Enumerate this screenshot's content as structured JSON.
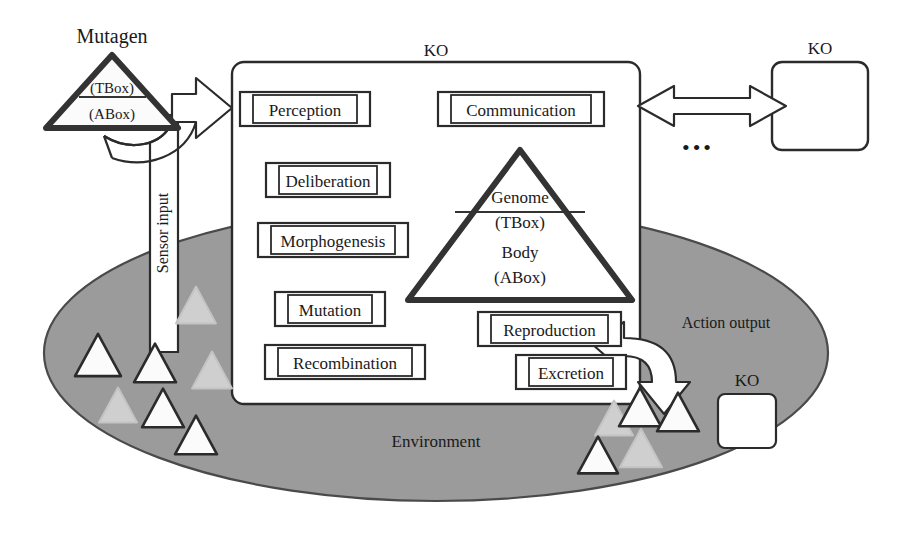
{
  "colors": {
    "environment_fill": "#9b9b9b",
    "environment_stroke": "#4a4a4a",
    "stroke": "#2b2b2b",
    "thick_stroke": "#333333",
    "triangle_white": "#fbfbfb",
    "triangle_faded": "#cfcfcf",
    "panel_fill": "#ffffff",
    "text": "#1a1a1a"
  },
  "labels": {
    "mutagen": "Mutagen",
    "ko_main": "KO",
    "ko_peer": "KO",
    "ko_env": "KO",
    "environment": "Environment",
    "sensor_input": "Sensor input",
    "action_output": "Action output",
    "ellipsis": "•••"
  },
  "mutagen_triangle": {
    "top_label": "(TBox)",
    "bottom_label": "(ABox)"
  },
  "genome_triangle": {
    "top_line1": "Genome",
    "top_line2": "(TBox)",
    "bottom_line1": "Body",
    "bottom_line2": "(ABox)"
  },
  "modules": [
    {
      "id": "perception",
      "label": "Perception",
      "x": 240,
      "y": 92,
      "w": 130,
      "h": 34
    },
    {
      "id": "communication",
      "label": "Communication",
      "x": 438,
      "y": 92,
      "w": 166,
      "h": 34
    },
    {
      "id": "deliberation",
      "label": "Deliberation",
      "x": 266,
      "y": 163,
      "w": 124,
      "h": 34
    },
    {
      "id": "morphogenesis",
      "label": "Morphogenesis",
      "x": 258,
      "y": 223,
      "w": 150,
      "h": 34
    },
    {
      "id": "mutation",
      "label": "Mutation",
      "x": 275,
      "y": 292,
      "w": 110,
      "h": 34
    },
    {
      "id": "recombination",
      "label": "Recombination",
      "x": 265,
      "y": 345,
      "w": 160,
      "h": 34
    },
    {
      "id": "reproduction",
      "label": "Reproduction",
      "x": 478,
      "y": 312,
      "w": 143,
      "h": 34
    },
    {
      "id": "excretion",
      "label": "Excretion",
      "x": 516,
      "y": 355,
      "w": 110,
      "h": 34
    }
  ],
  "ko_main_box": {
    "x": 232,
    "y": 62,
    "w": 408,
    "h": 342,
    "r": 12
  },
  "ko_peer_box": {
    "x": 772,
    "y": 62,
    "w": 96,
    "h": 88,
    "r": 10
  },
  "ko_env_box": {
    "x": 718,
    "y": 394,
    "w": 58,
    "h": 54,
    "r": 7
  },
  "environment_ellipse": {
    "cx": 436,
    "cy": 353,
    "rx": 392,
    "ry": 148
  },
  "env_triangles": [
    {
      "x": 98,
      "y": 355,
      "s": 46,
      "style": "white"
    },
    {
      "x": 155,
      "y": 363,
      "s": 42,
      "style": "white"
    },
    {
      "x": 196,
      "y": 305,
      "s": 40,
      "style": "faded"
    },
    {
      "x": 212,
      "y": 370,
      "s": 40,
      "style": "faded"
    },
    {
      "x": 118,
      "y": 405,
      "s": 38,
      "style": "faded"
    },
    {
      "x": 163,
      "y": 408,
      "s": 42,
      "style": "white"
    },
    {
      "x": 196,
      "y": 435,
      "s": 42,
      "style": "white"
    },
    {
      "x": 614,
      "y": 418,
      "s": 38,
      "style": "faded"
    },
    {
      "x": 640,
      "y": 407,
      "s": 42,
      "style": "white"
    },
    {
      "x": 678,
      "y": 412,
      "s": 42,
      "style": "white"
    },
    {
      "x": 598,
      "y": 455,
      "s": 40,
      "style": "white"
    },
    {
      "x": 641,
      "y": 448,
      "s": 42,
      "style": "faded"
    }
  ]
}
